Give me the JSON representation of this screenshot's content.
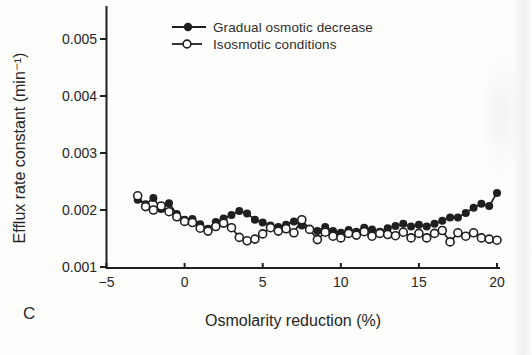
{
  "panel_label": "C",
  "colors": {
    "ink": "#1f1f1f",
    "background": "#fdfdfc"
  },
  "chart_data": {
    "type": "line",
    "title": "",
    "xlabel": "Osmolarity reduction (%)",
    "ylabel": "Efflux rate constant (min⁻¹)",
    "xlim": [
      -5,
      20
    ],
    "ylim": [
      0.001,
      0.005
    ],
    "grid": false,
    "legend_position": "top-center-inside",
    "x_ticks": [
      -5,
      0,
      5,
      10,
      15,
      20
    ],
    "x_tick_labels": [
      "−5",
      "0",
      "5",
      "10",
      "15",
      "20"
    ],
    "y_ticks": [
      0.001,
      0.002,
      0.003,
      0.004,
      0.005
    ],
    "y_tick_labels": [
      "0.001",
      "0.002",
      "0.003",
      "0.004",
      "0.005"
    ],
    "x": [
      -3,
      -2.5,
      -2,
      -1.5,
      -1,
      -0.5,
      0,
      0.5,
      1,
      1.5,
      2,
      2.5,
      3,
      3.5,
      4,
      4.5,
      5,
      5.5,
      6,
      6.5,
      7,
      7.5,
      8,
      8.5,
      9,
      9.5,
      10,
      10.5,
      11,
      11.5,
      12,
      12.5,
      13,
      13.5,
      14,
      14.5,
      15,
      15.5,
      16,
      16.5,
      17,
      17.5,
      18,
      18.5,
      19,
      19.5,
      20
    ],
    "series": [
      {
        "name": "Gradual osmotic decrease",
        "marker": "filled-circle",
        "values": [
          0.00218,
          0.0021,
          0.00221,
          0.00202,
          0.00212,
          0.00193,
          0.00183,
          0.00184,
          0.00175,
          0.00167,
          0.00179,
          0.00185,
          0.00191,
          0.00198,
          0.00194,
          0.00183,
          0.00178,
          0.00173,
          0.0017,
          0.00174,
          0.0018,
          0.00173,
          0.00166,
          0.00163,
          0.0017,
          0.00163,
          0.0016,
          0.00165,
          0.00162,
          0.00169,
          0.00166,
          0.00162,
          0.00168,
          0.00172,
          0.00176,
          0.00171,
          0.00174,
          0.00171,
          0.00176,
          0.00181,
          0.00187,
          0.00187,
          0.00195,
          0.00204,
          0.00211,
          0.00207,
          0.0023
        ]
      },
      {
        "name": "Isosmotic conditions",
        "marker": "open-circle",
        "values": [
          0.00225,
          0.00206,
          0.002,
          0.00207,
          0.00197,
          0.00188,
          0.0018,
          0.00178,
          0.00168,
          0.00163,
          0.00171,
          0.00177,
          0.00169,
          0.00152,
          0.00146,
          0.00149,
          0.00158,
          0.00169,
          0.00163,
          0.00167,
          0.0016,
          0.00183,
          0.00166,
          0.00148,
          0.00161,
          0.00154,
          0.00151,
          0.00159,
          0.00156,
          0.00162,
          0.00154,
          0.00159,
          0.00157,
          0.00155,
          0.00161,
          0.00151,
          0.00159,
          0.00151,
          0.00159,
          0.00164,
          0.00144,
          0.0016,
          0.00154,
          0.0016,
          0.00151,
          0.00149,
          0.00147
        ]
      }
    ]
  }
}
